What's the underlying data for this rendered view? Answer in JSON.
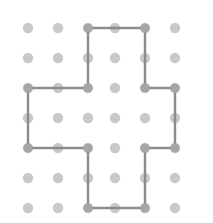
{
  "figure": {
    "width": 213,
    "height": 223,
    "background_color": "#ffffff"
  },
  "lattice": {
    "name": "dot-grid",
    "columns": 6,
    "rows": 7,
    "dot_color": "#c9c9c9",
    "dot_radius": 5.2,
    "x_positions": [
      28,
      58,
      88,
      115,
      145,
      175
    ],
    "y_positions": [
      28,
      58,
      88,
      118,
      148,
      178,
      208
    ],
    "visible_rows_y": [
      28,
      58,
      88,
      118,
      148,
      178,
      208
    ]
  },
  "polygon": {
    "name": "cross-polygon",
    "shape": "plus",
    "stroke_color": "#8c8c8c",
    "stroke_width": 2.4,
    "fill": "none",
    "closed": true,
    "vertices": [
      {
        "x": 88,
        "y": 28
      },
      {
        "x": 145,
        "y": 28
      },
      {
        "x": 145,
        "y": 88
      },
      {
        "x": 175,
        "y": 88
      },
      {
        "x": 175,
        "y": 148
      },
      {
        "x": 145,
        "y": 148
      },
      {
        "x": 145,
        "y": 208
      },
      {
        "x": 88,
        "y": 208
      },
      {
        "x": 88,
        "y": 148
      },
      {
        "x": 28,
        "y": 148
      },
      {
        "x": 28,
        "y": 88
      },
      {
        "x": 88,
        "y": 88
      }
    ],
    "path_d": "M 88 28 L 145 28 L 145 88 L 175 88 L 175 148 L 145 148 L 145 208 L 88 208 L 88 148 L 28 148 L 28 88 L 88 88 Z"
  },
  "chart_data": {
    "type": "scatter",
    "xlabel": "",
    "ylabel": "",
    "xlim": [
      0,
      213
    ],
    "ylim": [
      0,
      223
    ],
    "grid": false,
    "legend": "none",
    "series": [
      {
        "name": "lattice points",
        "marker": "circle",
        "color": "#c9c9c9",
        "x": [
          28,
          58,
          88,
          115,
          145,
          175,
          28,
          58,
          88,
          115,
          145,
          175,
          28,
          58,
          88,
          115,
          145,
          175,
          28,
          58,
          88,
          115,
          145,
          175,
          28,
          58,
          88,
          115,
          145,
          175,
          28,
          58,
          88,
          115,
          145,
          175,
          28,
          58,
          88,
          115,
          145,
          175
        ],
        "y": [
          28,
          28,
          28,
          28,
          28,
          28,
          58,
          58,
          58,
          58,
          58,
          58,
          88,
          88,
          88,
          88,
          88,
          88,
          118,
          118,
          118,
          118,
          118,
          118,
          148,
          148,
          148,
          148,
          148,
          148,
          178,
          178,
          178,
          178,
          178,
          178,
          208,
          208,
          208,
          208,
          208,
          208
        ]
      },
      {
        "name": "cross polygon outline",
        "marker": "none",
        "color": "#8c8c8c",
        "x": [
          88,
          145,
          145,
          175,
          175,
          145,
          145,
          88,
          88,
          28,
          28,
          88,
          88
        ],
        "y": [
          28,
          28,
          88,
          88,
          148,
          148,
          208,
          208,
          148,
          148,
          88,
          88,
          28
        ]
      }
    ]
  }
}
